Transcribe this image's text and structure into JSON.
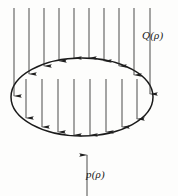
{
  "figure": {
    "background_color": "#fdfdfc",
    "stroke_color": "#1a1a1a",
    "arrow_color": "#262626",
    "width": 178,
    "height": 196,
    "labels": {
      "incident_load": "Q(ρ)",
      "reaction_pressure": "p(ρ)"
    },
    "ellipse": {
      "center_x": 82,
      "center_y": 97,
      "radius_x": 71,
      "radius_y": 39,
      "stroke_width": 1.4
    },
    "incident_arrows": {
      "direction": "down",
      "count": 10,
      "start_y": 8,
      "items": [
        {
          "x": 14,
          "y_end": 96
        },
        {
          "x": 29,
          "y_end": 74
        },
        {
          "x": 44,
          "y_end": 66
        },
        {
          "x": 59,
          "y_end": 61
        },
        {
          "x": 74,
          "y_end": 58
        },
        {
          "x": 89,
          "y_end": 58
        },
        {
          "x": 104,
          "y_end": 61
        },
        {
          "x": 119,
          "y_end": 66
        },
        {
          "x": 134,
          "y_end": 75
        },
        {
          "x": 150,
          "y_end": 94
        }
      ]
    },
    "interior_arrows": {
      "direction": "down",
      "count": 8,
      "start_y": 79,
      "items": [
        {
          "x": 26,
          "y_end": 118
        },
        {
          "x": 42,
          "y_end": 127
        },
        {
          "x": 58,
          "y_end": 132
        },
        {
          "x": 74,
          "y_end": 135
        },
        {
          "x": 90,
          "y_end": 135
        },
        {
          "x": 106,
          "y_end": 132
        },
        {
          "x": 122,
          "y_end": 127
        },
        {
          "x": 137,
          "y_end": 119
        }
      ]
    },
    "reaction_arrow": {
      "direction": "up",
      "x": 87,
      "y_start": 196,
      "y_end": 155
    }
  }
}
